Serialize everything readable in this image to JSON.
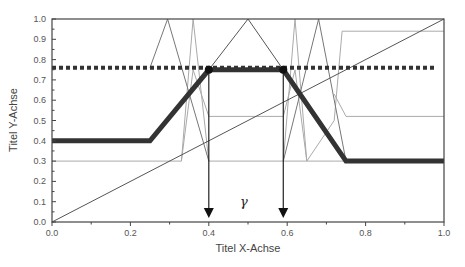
{
  "chart_data": {
    "type": "line",
    "title": "",
    "xlabel": "Titel X-Achse",
    "ylabel": "Titel Y-Achse",
    "xlim": [
      0.0,
      1.0
    ],
    "ylim": [
      0.0,
      1.0
    ],
    "x_ticks": [
      "0.0",
      "0.2",
      "0.4",
      "0.6",
      "0.8",
      "1.0"
    ],
    "y_ticks": [
      "0.0",
      "0.1",
      "0.2",
      "0.3",
      "0.4",
      "0.5",
      "0.6",
      "0.7",
      "0.8",
      "0.9",
      "1.0"
    ],
    "grid": false,
    "legend": null,
    "annotations": [
      {
        "text": "γ",
        "x": 0.495,
        "y": 0.1
      },
      {
        "type": "arrow",
        "x": 0.4,
        "from_y": 0.75,
        "to_y": 0.02
      },
      {
        "type": "arrow",
        "x": 0.59,
        "from_y": 0.75,
        "to_y": 0.02
      }
    ],
    "series": [
      {
        "name": "thick-profile",
        "style": "thick-dark",
        "x": [
          0.0,
          0.25,
          0.4,
          0.59,
          0.75,
          1.0
        ],
        "y": [
          0.4,
          0.4,
          0.75,
          0.75,
          0.3,
          0.3
        ]
      },
      {
        "name": "dotted-threshold",
        "style": "dotted",
        "x": [
          0.0,
          0.98
        ],
        "y": [
          0.76,
          0.76
        ]
      },
      {
        "name": "diagonal",
        "style": "thin-dark",
        "x": [
          0.0,
          1.0
        ],
        "y": [
          0.0,
          1.0
        ]
      },
      {
        "name": "triangle-peak",
        "style": "thin-dark",
        "x": [
          0.4,
          0.5,
          0.59
        ],
        "y": [
          0.75,
          1.0,
          0.75
        ]
      },
      {
        "name": "zigzag-left",
        "style": "thin-medium",
        "x": [
          0.25,
          0.295,
          0.4
        ],
        "y": [
          0.76,
          1.0,
          0.3
        ]
      },
      {
        "name": "zigzag-left-2",
        "style": "thin-light",
        "x": [
          0.33,
          0.36,
          0.4
        ],
        "y": [
          0.3,
          1.0,
          0.3
        ]
      },
      {
        "name": "zigzag-right",
        "style": "thin-medium",
        "x": [
          0.59,
          0.68,
          0.75
        ],
        "y": [
          0.3,
          1.0,
          0.3
        ]
      },
      {
        "name": "zigzag-right-2",
        "style": "thin-light",
        "x": [
          0.59,
          0.62,
          0.65
        ],
        "y": [
          0.3,
          1.0,
          0.3
        ]
      },
      {
        "name": "lower-step",
        "style": "thin-light",
        "x": [
          0.0,
          0.33,
          0.36,
          0.4,
          0.59,
          0.62,
          0.65,
          0.72,
          1.0
        ],
        "y": [
          0.3,
          0.3,
          0.75,
          0.52,
          0.52,
          0.75,
          0.3,
          0.3,
          0.3
        ]
      },
      {
        "name": "upper-step",
        "style": "thin-light",
        "x": [
          0.4,
          0.59,
          0.65,
          0.72,
          0.74,
          1.0
        ],
        "y": [
          0.3,
          0.3,
          0.3,
          0.5,
          0.94,
          0.94
        ]
      },
      {
        "name": "right-step-low",
        "style": "thin-light",
        "x": [
          0.72,
          0.75,
          1.0
        ],
        "y": [
          0.63,
          0.52,
          0.52
        ]
      }
    ],
    "markers": [
      {
        "x": 0.4,
        "y": 0.75
      },
      {
        "x": 0.59,
        "y": 0.75
      }
    ]
  },
  "colors": {
    "thick": "#333333",
    "thin_dark": "#555555",
    "thin_medium": "#777777",
    "thin_light": "#aaaaaa",
    "axis": "#444444"
  }
}
